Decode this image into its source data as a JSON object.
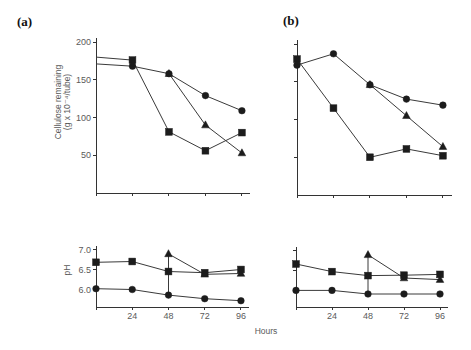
{
  "figure": {
    "panel_labels": [
      "(a)",
      "(b)"
    ],
    "xlabel": "Hours",
    "ylabel_top_lines": [
      "Cellulose remaining",
      "(g x 10⁻⁴/tube)"
    ],
    "ylabel_bottom": "pH",
    "colors": {
      "line": "#3a3a3a",
      "marker": "#1c1c1c",
      "axis": "#333333",
      "tick_text": "#5a5a5a"
    }
  },
  "chart_data": [
    {
      "panel": "(a)",
      "type": "line",
      "title": "",
      "xlabel": "",
      "ylabel": "Cellulose remaining (g x 10⁻⁴/tube)",
      "x": [
        0,
        24,
        48,
        72,
        96
      ],
      "xticks": [
        "24",
        "48",
        "72",
        "96"
      ],
      "show_xtick_labels": false,
      "yticks": [
        "50",
        "100",
        "150",
        "200"
      ],
      "show_ytick_labels": true,
      "ylim": [
        0,
        200
      ],
      "grid": false,
      "hide_markers_at_x0": true,
      "series": [
        {
          "name": "square",
          "marker": "square",
          "values": [
            180,
            176,
            81,
            56,
            80
          ]
        },
        {
          "name": "circle",
          "marker": "circle",
          "values": [
            171,
            168,
            158,
            129,
            109
          ]
        },
        {
          "name": "triangle",
          "marker": "triangle",
          "values": [
            null,
            null,
            158,
            90,
            53
          ],
          "branch_from": "circle",
          "branch_index": 2
        }
      ]
    },
    {
      "panel": "(b)",
      "type": "line",
      "title": "",
      "xlabel": "",
      "ylabel": "",
      "x": [
        0,
        24,
        48,
        72,
        96
      ],
      "xticks": [
        "24",
        "48",
        "72",
        "96"
      ],
      "show_xtick_labels": false,
      "yticks": [
        "50",
        "100",
        "150",
        "200"
      ],
      "show_ytick_labels": false,
      "ylim": [
        0,
        200
      ],
      "grid": false,
      "hide_markers_at_x0": false,
      "series": [
        {
          "name": "square",
          "marker": "square",
          "values": [
            180,
            115,
            50,
            61,
            52
          ]
        },
        {
          "name": "circle",
          "marker": "circle",
          "values": [
            172,
            187,
            146,
            127,
            119
          ]
        },
        {
          "name": "triangle",
          "marker": "triangle",
          "values": [
            null,
            null,
            146,
            105,
            64
          ],
          "branch_from": "circle",
          "branch_index": 2
        }
      ]
    },
    {
      "panel": "(a)",
      "type": "line",
      "title": "",
      "xlabel": "Hours",
      "ylabel": "pH",
      "x": [
        0,
        24,
        48,
        72,
        96
      ],
      "xticks": [
        "24",
        "48",
        "72",
        "96"
      ],
      "show_xtick_labels": true,
      "yticks": [
        "6.0",
        "6.5",
        "7.0"
      ],
      "show_ytick_labels": true,
      "ylim": [
        5.55,
        7.1
      ],
      "grid": false,
      "hide_markers_at_x0": false,
      "series": [
        {
          "name": "square",
          "marker": "square",
          "values": [
            6.68,
            6.7,
            6.45,
            6.42,
            6.5
          ]
        },
        {
          "name": "circle",
          "marker": "circle",
          "values": [
            6.02,
            6.0,
            5.86,
            5.77,
            5.72
          ]
        },
        {
          "name": "triangle",
          "marker": "triangle",
          "values": [
            null,
            null,
            6.89,
            6.38,
            6.4
          ],
          "branch_from": "circle",
          "branch_index": 2
        }
      ]
    },
    {
      "panel": "(b)",
      "type": "line",
      "title": "",
      "xlabel": "Hours",
      "ylabel": "",
      "x": [
        0,
        24,
        48,
        72,
        96
      ],
      "xticks": [
        "24",
        "48",
        "72",
        "96"
      ],
      "show_xtick_labels": true,
      "yticks": [
        "6.0",
        "6.5",
        "7.0"
      ],
      "show_ytick_labels": false,
      "ylim": [
        5.55,
        7.1
      ],
      "grid": false,
      "hide_markers_at_x0": false,
      "series": [
        {
          "name": "square",
          "marker": "square",
          "values": [
            6.65,
            6.46,
            6.36,
            6.37,
            6.39
          ]
        },
        {
          "name": "circle",
          "marker": "circle",
          "values": [
            5.99,
            5.99,
            5.9,
            5.9,
            5.9
          ]
        },
        {
          "name": "triangle",
          "marker": "triangle",
          "values": [
            null,
            null,
            6.88,
            6.3,
            6.26
          ],
          "branch_from": "circle",
          "branch_index": 2
        }
      ]
    }
  ]
}
